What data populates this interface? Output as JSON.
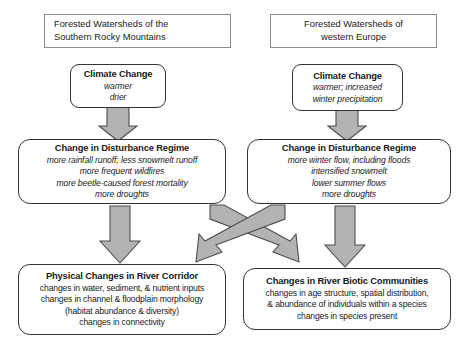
{
  "diagram": {
    "colors": {
      "arrow_fill": "#b3b3b3",
      "arrow_stroke": "#4d4d4d",
      "box_border": "#333333",
      "header_border": "#8c8c8c",
      "background": "#ffffff",
      "text": "#1a1a1a"
    },
    "columns": [
      {
        "id": "southern-rocky-mountains",
        "header": {
          "line1": "Forested Watersheds of the",
          "line2": "Southern Rocky Mountains"
        },
        "climate_change": {
          "title": "Climate Change",
          "items": [
            "warmer",
            "drier"
          ]
        },
        "disturbance_regime": {
          "title": "Change in Disturbance Regime",
          "items": [
            "more rainfall runoff; less snowmelt runoff",
            "more frequent wildfires",
            "more beetle-caused forest mortality",
            "more droughts"
          ]
        }
      },
      {
        "id": "western-europe",
        "header": {
          "line1": "Forested Watersheds of",
          "line2": "western Europe"
        },
        "climate_change": {
          "title": "Climate Change",
          "items": [
            "warmer; increased",
            "winter precipitation"
          ]
        },
        "disturbance_regime": {
          "title": "Change in Disturbance Regime",
          "items": [
            "more winter flow, including floods",
            "intensified snowmelt",
            "lower summer flows",
            "more droughts"
          ]
        }
      }
    ],
    "outcomes": [
      {
        "id": "physical-changes-river-corridor",
        "title": "Physical Changes in River Corridor",
        "items": [
          "changes in water, sediment, & nutrient inputs",
          "changes in channel & floodplain morphology",
          "(habitat abundance & diversity)",
          "changes in connectivity"
        ]
      },
      {
        "id": "changes-river-biotic-communities",
        "title": "Changes in River Biotic Communities",
        "items": [
          "changes in age structure, spatial distribution,",
          "& abundance of individuals within a species",
          "changes in species present"
        ]
      }
    ],
    "arrows": [
      {
        "id": "left-climate-to-disturbance",
        "direction": "down",
        "from": "climate_change_left",
        "to": "disturbance_regime_left"
      },
      {
        "id": "right-climate-to-disturbance",
        "direction": "down",
        "from": "climate_change_right",
        "to": "disturbance_regime_right"
      },
      {
        "id": "left-disturbance-to-physical",
        "direction": "down",
        "from": "disturbance_regime_left",
        "to": "physical_changes"
      },
      {
        "id": "right-disturbance-to-biotic",
        "direction": "down",
        "from": "disturbance_regime_right",
        "to": "biotic_communities"
      },
      {
        "id": "left-disturbance-to-biotic-diagonal",
        "direction": "down-right",
        "from": "disturbance_regime_left",
        "to": "biotic_communities"
      },
      {
        "id": "right-disturbance-to-physical-diagonal",
        "direction": "down-left",
        "from": "disturbance_regime_right",
        "to": "physical_changes"
      }
    ]
  }
}
